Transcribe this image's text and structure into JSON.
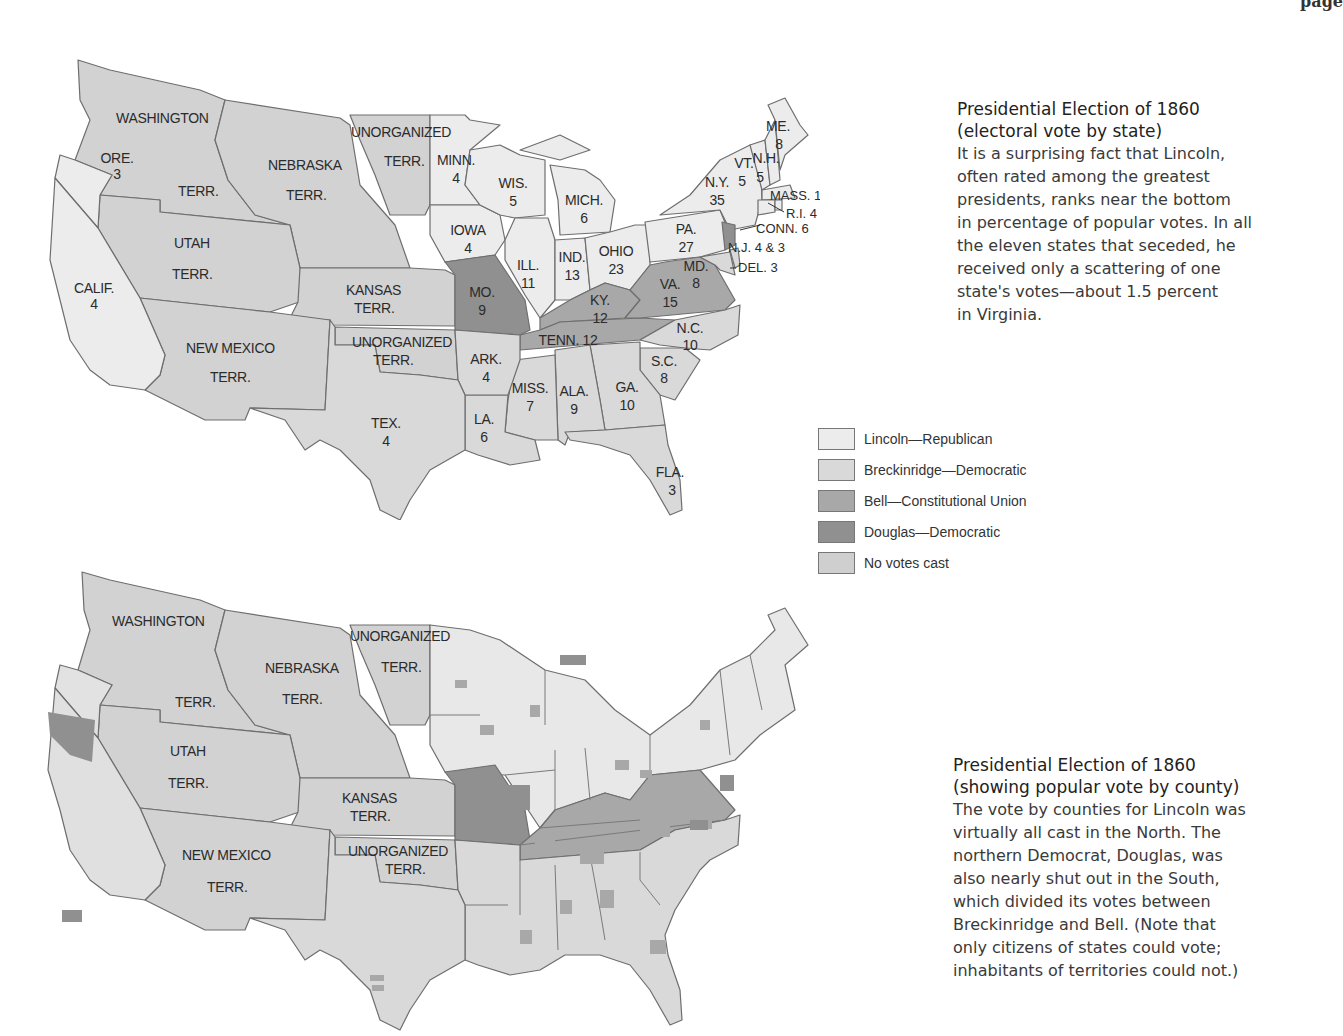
{
  "page": {
    "header_fragment": "page"
  },
  "colors": {
    "lincoln": "#ececec",
    "breckinridge": "#d9d9d9",
    "bell": "#a8a8a8",
    "douglas": "#909090",
    "no_votes": "#cfcfcf",
    "border": "#6e6e6e"
  },
  "top_caption": {
    "title_line1": "Presidential Election of 1860",
    "title_line2": "(electoral vote by state)",
    "body": [
      "It is a surprising fact that Lincoln,",
      "often rated among the greatest",
      "presidents, ranks near the bottom",
      "in percentage of popular votes. In all",
      "the eleven states that seceded, he",
      "received only a scattering of one",
      "state's votes—about 1.5 percent",
      "in Virginia."
    ]
  },
  "bottom_caption": {
    "title_line1": "Presidential Election of 1860",
    "title_line2": "(showing popular vote by county)",
    "body": [
      "The vote by counties for Lincoln was",
      "virtually all cast in the North. The",
      "northern Democrat, Douglas, was",
      "also nearly shut out in the South,",
      "which divided its votes between",
      "Breckinridge and Bell. (Note that",
      "only citizens of states could vote;",
      "inhabitants of territories could not.)"
    ]
  },
  "legend": [
    {
      "label": "Lincoln—Republican",
      "color": "#ececec"
    },
    {
      "label": "Breckinridge—Democratic",
      "color": "#d9d9d9"
    },
    {
      "label": "Bell—Constitutional Union",
      "color": "#a8a8a8"
    },
    {
      "label": "Douglas—Democratic",
      "color": "#909090"
    },
    {
      "label": "No votes cast",
      "color": "#cfcfcf"
    }
  ],
  "electoral_map": {
    "territories": {
      "washington": "WASHINGTON",
      "washington_terr": "TERR.",
      "nebraska": "NEBRASKA",
      "nebraska_terr": "TERR.",
      "unorganized_north": "UNORGANIZED",
      "unorganized_north_terr": "TERR.",
      "utah": "UTAH",
      "utah_terr": "TERR.",
      "kansas": "KANSAS",
      "kansas_terr": "TERR.",
      "new_mexico": "NEW MEXICO",
      "new_mexico_terr": "TERR.",
      "unorganized_south": "UNORGANIZED",
      "unorganized_south_terr": "TERR."
    },
    "states": {
      "ore": {
        "abbr": "ORE.",
        "votes": "3"
      },
      "calif": {
        "abbr": "CALIF.",
        "votes": "4"
      },
      "minn": {
        "abbr": "MINN.",
        "votes": "4"
      },
      "iowa": {
        "abbr": "IOWA",
        "votes": "4"
      },
      "wis": {
        "abbr": "WIS.",
        "votes": "5"
      },
      "mich": {
        "abbr": "MICH.",
        "votes": "6"
      },
      "ill": {
        "abbr": "ILL.",
        "votes": "11"
      },
      "ind": {
        "abbr": "IND.",
        "votes": "13"
      },
      "ohio": {
        "abbr": "OHIO",
        "votes": "23"
      },
      "mo": {
        "abbr": "MO.",
        "votes": "9"
      },
      "ky": {
        "abbr": "KY.",
        "votes": "12"
      },
      "tenn": {
        "label": "TENN. 12"
      },
      "va": {
        "abbr": "VA.",
        "votes": "15"
      },
      "md": {
        "abbr": "MD.",
        "votes": "8"
      },
      "nc": {
        "abbr": "N.C.",
        "votes": "10"
      },
      "sc": {
        "abbr": "S.C.",
        "votes": "8"
      },
      "ga": {
        "abbr": "GA.",
        "votes": "10"
      },
      "ala": {
        "abbr": "ALA.",
        "votes": "9"
      },
      "miss": {
        "abbr": "MISS.",
        "votes": "7"
      },
      "la": {
        "abbr": "LA.",
        "votes": "6"
      },
      "ark": {
        "abbr": "ARK.",
        "votes": "4"
      },
      "tex": {
        "abbr": "TEX.",
        "votes": "4"
      },
      "fla": {
        "abbr": "FLA.",
        "votes": "3"
      },
      "pa": {
        "abbr": "PA.",
        "votes": "27"
      },
      "ny": {
        "abbr": "N.Y.",
        "votes": "35"
      },
      "vt": {
        "abbr": "VT.",
        "votes": "5"
      },
      "nh": {
        "abbr": "N.H.",
        "votes": "5"
      },
      "me": {
        "abbr": "ME.",
        "votes": "8"
      },
      "mass": {
        "label": "MASS. 13"
      },
      "ri": {
        "label": "R.I. 4"
      },
      "conn": {
        "label": "CONN. 6"
      },
      "nj": {
        "label": "N.J. 4 & 3"
      },
      "del": {
        "label": "DEL. 3"
      }
    }
  },
  "county_map": {
    "territories": {
      "washington": "WASHINGTON",
      "washington_terr": "TERR.",
      "nebraska": "NEBRASKA",
      "nebraska_terr": "TERR.",
      "unorganized_north": "UNORGANIZED",
      "unorganized_north_terr": "TERR.",
      "utah": "UTAH",
      "utah_terr": "TERR.",
      "kansas": "KANSAS",
      "kansas_terr": "TERR.",
      "new_mexico": "NEW MEXICO",
      "new_mexico_terr": "TERR.",
      "unorganized_south": "UNORGANIZED",
      "unorganized_south_terr": "TERR."
    }
  }
}
